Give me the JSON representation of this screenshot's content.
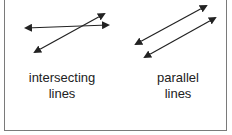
{
  "diagram": {
    "colors": {
      "line": "#222222",
      "frame": "#7a7a7a",
      "text": "#222222"
    },
    "panels": [
      {
        "id": "intersecting",
        "label_line1": "intersecting",
        "label_line2": "lines",
        "lines": [
          {
            "x1": 26,
            "y1": 28,
            "x2": 108,
            "y2": 25
          },
          {
            "x1": 35,
            "y1": 52,
            "x2": 104,
            "y2": 14
          }
        ]
      },
      {
        "id": "parallel",
        "label_line1": "parallel",
        "label_line2": "lines",
        "lines": [
          {
            "x1": 136,
            "y1": 44,
            "x2": 206,
            "y2": 6
          },
          {
            "x1": 145,
            "y1": 57,
            "x2": 215,
            "y2": 18
          }
        ]
      }
    ]
  }
}
